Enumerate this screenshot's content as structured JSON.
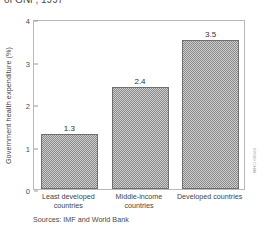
{
  "chart_data": {
    "type": "bar",
    "title": "of GNP, 1997",
    "categories": [
      "Least developed countries",
      "Middle-income countries",
      "Developed countries"
    ],
    "values": [
      1.3,
      2.4,
      3.5
    ],
    "value_labels": [
      "1.3",
      "2.4",
      "3.5"
    ],
    "xlabel": "",
    "ylabel": "Government health expenditure (%)",
    "ylim": [
      0,
      4
    ],
    "yticks": [
      0,
      1,
      2,
      3,
      4
    ],
    "ytick_labels": [
      "0",
      "1",
      "2",
      "3",
      "4"
    ],
    "grid": false,
    "legend": false,
    "bar_color": "#8c8c8c",
    "bar_edge_color": "#6f6f6f",
    "frame_color": "#b9b9b9"
  },
  "footer": {
    "source": "Sources: IMF and World Bank"
  },
  "credit": {
    "text": "WHO 00046"
  }
}
